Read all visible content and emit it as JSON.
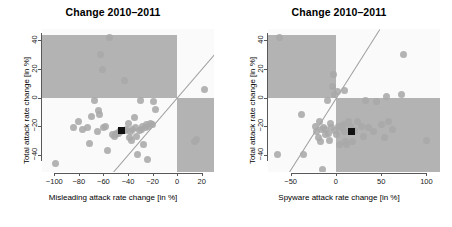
{
  "figure": {
    "width": 452,
    "height": 227,
    "background": "#ffffff",
    "point_color": "#a8a8a8",
    "shade_color": "#b3b3b3",
    "line_color": "#9e9e9e",
    "median_color": "#111111"
  },
  "chart_data": [
    {
      "type": "scatter",
      "panel": "left",
      "title": "Change 2010–2011",
      "xlabel": "Misleading attack rate change [in %]",
      "ylabel": "Total attack rate change [in %]",
      "xlim": [
        -110,
        30
      ],
      "ylim": [
        -52,
        48
      ],
      "xticks": [
        -100,
        -80,
        -60,
        -40,
        -20,
        0,
        20
      ],
      "yticks": [
        40,
        20,
        0,
        -20,
        -40
      ],
      "grid": false,
      "legend": "none",
      "annotations": [
        "shaded quadrant upper-left (x<0, y>0)",
        "shaded quadrant lower-right (x>0, y<0)",
        "grey diagonal identity line y = x",
        "black square marks the median point"
      ],
      "reference_line": {
        "type": "identity",
        "slope": 1,
        "intercept": 0
      },
      "median_point": {
        "x": -45,
        "y": -23
      },
      "points": [
        {
          "x": -99,
          "y": -46
        },
        {
          "x": -84,
          "y": -21
        },
        {
          "x": -80,
          "y": -17
        },
        {
          "x": -77,
          "y": -22
        },
        {
          "x": -73,
          "y": -21
        },
        {
          "x": -71,
          "y": -32
        },
        {
          "x": -70,
          "y": -13
        },
        {
          "x": -67,
          "y": -2
        },
        {
          "x": -65,
          "y": -24
        },
        {
          "x": -64,
          "y": -9
        },
        {
          "x": -63,
          "y": -12
        },
        {
          "x": -62,
          "y": 30
        },
        {
          "x": -61,
          "y": 20
        },
        {
          "x": -60,
          "y": -21
        },
        {
          "x": -58,
          "y": -20
        },
        {
          "x": -57,
          "y": -37
        },
        {
          "x": -55,
          "y": 42
        },
        {
          "x": -53,
          "y": -26
        },
        {
          "x": -51,
          "y": -27
        },
        {
          "x": -50,
          "y": -26
        },
        {
          "x": -49,
          "y": -25
        },
        {
          "x": -48,
          "y": -25
        },
        {
          "x": -47,
          "y": -24
        },
        {
          "x": -46,
          "y": -24
        },
        {
          "x": -44,
          "y": -23
        },
        {
          "x": -43,
          "y": 12
        },
        {
          "x": -42,
          "y": -23
        },
        {
          "x": -41,
          "y": -22
        },
        {
          "x": -40,
          "y": -18
        },
        {
          "x": -39,
          "y": -28
        },
        {
          "x": -38,
          "y": -24
        },
        {
          "x": -37,
          "y": -30
        },
        {
          "x": -36,
          "y": -22
        },
        {
          "x": -35,
          "y": -14
        },
        {
          "x": -34,
          "y": -21
        },
        {
          "x": -33,
          "y": -27
        },
        {
          "x": -32,
          "y": -40
        },
        {
          "x": -31,
          "y": -23
        },
        {
          "x": -30,
          "y": -2
        },
        {
          "x": -29,
          "y": -22
        },
        {
          "x": -28,
          "y": -20
        },
        {
          "x": -27,
          "y": -33
        },
        {
          "x": -26,
          "y": -21
        },
        {
          "x": -25,
          "y": -19
        },
        {
          "x": -24,
          "y": -43
        },
        {
          "x": -23,
          "y": -20
        },
        {
          "x": -22,
          "y": -18
        },
        {
          "x": -20,
          "y": -19
        },
        {
          "x": -19,
          "y": -3
        },
        {
          "x": -18,
          "y": -8
        },
        {
          "x": 14,
          "y": -31
        },
        {
          "x": 16,
          "y": -29
        },
        {
          "x": 22,
          "y": 6
        }
      ]
    },
    {
      "type": "scatter",
      "panel": "right",
      "title": "Change 2010–2011",
      "xlabel": "Spyware attack rate change [in %]",
      "ylabel": "Total attack rate change [in %]",
      "xlim": [
        -75,
        115
      ],
      "ylim": [
        -52,
        48
      ],
      "xticks": [
        -50,
        0,
        50,
        100
      ],
      "yticks": [
        40,
        20,
        0,
        -20,
        -40
      ],
      "grid": false,
      "legend": "none",
      "annotations": [
        "shaded quadrant upper-left (x<0, y>0)",
        "shaded quadrant lower-right (x>0, y<0)",
        "grey diagonal identity line y = x",
        "black square marks the median point"
      ],
      "reference_line": {
        "type": "identity",
        "slope": 1,
        "intercept": 0
      },
      "median_point": {
        "x": 17,
        "y": -24
      },
      "points": [
        {
          "x": -64,
          "y": -40
        },
        {
          "x": -62,
          "y": 42
        },
        {
          "x": -38,
          "y": -12
        },
        {
          "x": -36,
          "y": -40
        },
        {
          "x": -23,
          "y": -20
        },
        {
          "x": -21,
          "y": -24
        },
        {
          "x": -19,
          "y": -28
        },
        {
          "x": -18,
          "y": -17
        },
        {
          "x": -17,
          "y": -31
        },
        {
          "x": -16,
          "y": -22
        },
        {
          "x": -15,
          "y": -50
        },
        {
          "x": -14,
          "y": -21
        },
        {
          "x": -12,
          "y": -22
        },
        {
          "x": -11,
          "y": -26
        },
        {
          "x": -9,
          "y": -2
        },
        {
          "x": -8,
          "y": -25
        },
        {
          "x": -7,
          "y": -30
        },
        {
          "x": -6,
          "y": -18
        },
        {
          "x": -5,
          "y": -21
        },
        {
          "x": -4,
          "y": 8
        },
        {
          "x": -3,
          "y": 16
        },
        {
          "x": -2,
          "y": 2
        },
        {
          "x": -1,
          "y": -23
        },
        {
          "x": 1,
          "y": -26
        },
        {
          "x": 2,
          "y": 4
        },
        {
          "x": 3,
          "y": -20
        },
        {
          "x": 4,
          "y": -33
        },
        {
          "x": 6,
          "y": -21
        },
        {
          "x": 8,
          "y": -19
        },
        {
          "x": 9,
          "y": 5
        },
        {
          "x": 10,
          "y": -24
        },
        {
          "x": 11,
          "y": -31
        },
        {
          "x": 12,
          "y": -33
        },
        {
          "x": 14,
          "y": -17
        },
        {
          "x": 16,
          "y": -20
        },
        {
          "x": 18,
          "y": -31
        },
        {
          "x": 20,
          "y": -23
        },
        {
          "x": 24,
          "y": -17
        },
        {
          "x": 28,
          "y": -20
        },
        {
          "x": 30,
          "y": -27
        },
        {
          "x": 33,
          "y": -2
        },
        {
          "x": 36,
          "y": -21
        },
        {
          "x": 42,
          "y": -24
        },
        {
          "x": 45,
          "y": -3
        },
        {
          "x": 50,
          "y": -19
        },
        {
          "x": 54,
          "y": -28
        },
        {
          "x": 56,
          "y": 1
        },
        {
          "x": 58,
          "y": -17
        },
        {
          "x": 62,
          "y": -22
        },
        {
          "x": 73,
          "y": 2
        },
        {
          "x": 75,
          "y": 30
        },
        {
          "x": 100,
          "y": -30
        }
      ]
    }
  ]
}
